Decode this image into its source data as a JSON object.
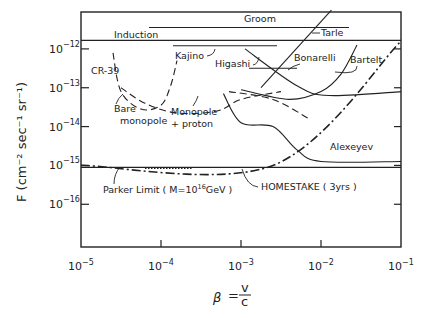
{
  "chart_data": {
    "type": "line",
    "title": "",
    "xlabel": "β = v/c",
    "xlabel_parts": {
      "symbol": "β",
      "eq": "=",
      "num": "v",
      "den": "c"
    },
    "ylabel": "F (cm⁻² sec⁻¹ sr⁻¹)",
    "xscale": "log",
    "yscale": "log",
    "xlim_exp": [
      -5,
      -1
    ],
    "ylim_exp": [
      -17.1,
      -11.05
    ],
    "grid": false,
    "x_ticks": [
      {
        "base": "10",
        "exp": "−5"
      },
      {
        "base": "10",
        "exp": "−4"
      },
      {
        "base": "10",
        "exp": "−3"
      },
      {
        "base": "10",
        "exp": "−2"
      },
      {
        "base": "10",
        "exp": "−1"
      }
    ],
    "x_tick_exps": [
      -5,
      -4,
      -3,
      -2,
      -1
    ],
    "y_ticks": [
      {
        "base": "10",
        "exp": "−12"
      },
      {
        "base": "10",
        "exp": "−13"
      },
      {
        "base": "10",
        "exp": "−14"
      },
      {
        "base": "10",
        "exp": "−15"
      },
      {
        "base": "10",
        "exp": "−16"
      }
    ],
    "y_tick_exps": [
      -12,
      -13,
      -14,
      -15,
      -16
    ],
    "series": [
      {
        "name": "Induction",
        "style": "solid",
        "points_log": [
          [
            -5,
            -11.78
          ],
          [
            -1,
            -11.78
          ]
        ]
      },
      {
        "name": "Groom",
        "style": "solid",
        "points_log": [
          [
            -4.15,
            -11.45
          ],
          [
            -1.65,
            -11.45
          ]
        ]
      },
      {
        "name": "Kajino",
        "style": "solid",
        "points_log": [
          [
            -3.85,
            -11.92
          ],
          [
            -2.55,
            -11.92
          ]
        ]
      },
      {
        "name": "Higashi",
        "style": "solid",
        "points_log": [
          [
            -2.9,
            -12.5
          ],
          [
            -2.3,
            -12.5
          ]
        ]
      },
      {
        "name": "Tarle",
        "style": "solid",
        "points_log": [
          [
            -2.75,
            -13.0
          ],
          [
            -1.87,
            -11.0
          ]
        ]
      },
      {
        "name": "Bonarelli",
        "style": "solid",
        "points_log": [
          [
            -2.95,
            -12.0
          ],
          [
            -2.3,
            -12.95
          ],
          [
            -1.9,
            -13.2
          ],
          [
            -1.0,
            -13.1
          ]
        ]
      },
      {
        "name": "Bartelt",
        "style": "solid",
        "points_log": [
          [
            -3.0,
            -13.05
          ],
          [
            -2.4,
            -13.3
          ],
          [
            -2.0,
            -13.1
          ],
          [
            -1.75,
            -12.65
          ],
          [
            -1.55,
            -11.9
          ]
        ]
      },
      {
        "name": "CR-39 bare monopole",
        "style": "dashed",
        "points_log": [
          [
            -4.6,
            -12.1
          ],
          [
            -4.5,
            -13.1
          ],
          [
            -4.25,
            -13.55
          ],
          [
            -4.0,
            -13.45
          ],
          [
            -3.88,
            -12.95
          ],
          [
            -3.8,
            -12.3
          ]
        ]
      },
      {
        "name": "CR-39 monopole + proton",
        "style": "dashed",
        "points_log": [
          [
            -4.5,
            -13.0
          ],
          [
            -4.2,
            -13.4
          ],
          [
            -3.8,
            -13.65
          ],
          [
            -3.3,
            -13.6
          ],
          [
            -3.0,
            -13.3
          ],
          [
            -2.5,
            -13.1
          ]
        ]
      },
      {
        "name": "Higashi extension",
        "style": "dashed",
        "points_log": [
          [
            -3.15,
            -13.1
          ],
          [
            -2.6,
            -13.3
          ],
          [
            -2.15,
            -13.8
          ]
        ]
      },
      {
        "name": "Alexeyev",
        "style": "solid",
        "points_log": [
          [
            -3.22,
            -13.15
          ],
          [
            -3.0,
            -13.9
          ],
          [
            -2.6,
            -14.0
          ],
          [
            -2.3,
            -14.6
          ],
          [
            -2.0,
            -14.9
          ],
          [
            -1.0,
            -14.9
          ]
        ]
      },
      {
        "name": "HOMESTAKE (3yrs)",
        "style": "solid",
        "points_log": [
          [
            -5,
            -15.05
          ],
          [
            -1,
            -15.05
          ]
        ]
      },
      {
        "name": "Parker Limit (M=10^16 GeV)",
        "style": "dashdot",
        "points_log": [
          [
            -5,
            -15.0
          ],
          [
            -2.6,
            -15.0
          ],
          [
            -1,
            -11.8
          ]
        ]
      },
      {
        "name": "dotted segment",
        "style": "dotted",
        "points_log": [
          [
            -4.2,
            -15.08
          ],
          [
            -3.6,
            -15.08
          ]
        ]
      }
    ],
    "annotations": [
      {
        "text": "Induction"
      },
      {
        "text": "Groom"
      },
      {
        "text": "Tarle"
      },
      {
        "text": "Kajino"
      },
      {
        "text": "Higashi"
      },
      {
        "text": "Bonarelli"
      },
      {
        "text": "Bartelt"
      },
      {
        "text": "CR-39"
      },
      {
        "text": "Bare"
      },
      {
        "text": "monopole"
      },
      {
        "text": "Monopole"
      },
      {
        "text": "+ proton"
      },
      {
        "text": "Alexeyev"
      },
      {
        "text": "Parker Limit  ( M=10"
      },
      {
        "text": "16"
      },
      {
        "text": "GeV )"
      },
      {
        "text": "HOMESTAKE  ( 3yrs )"
      }
    ],
    "legend": "none"
  }
}
